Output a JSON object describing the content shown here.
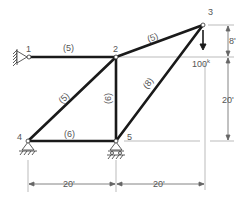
{
  "nodes": [
    {
      "id": "1",
      "label": "1"
    },
    {
      "id": "2",
      "label": "2"
    },
    {
      "id": "3",
      "label": "3"
    },
    {
      "id": "4",
      "label": "4"
    },
    {
      "id": "5",
      "label": "5"
    }
  ],
  "members": [
    {
      "from": "1",
      "to": "2",
      "label": "(5)"
    },
    {
      "from": "2",
      "to": "3",
      "label": "(5)"
    },
    {
      "from": "2",
      "to": "4",
      "label": "(5)"
    },
    {
      "from": "2",
      "to": "5",
      "label": "(6)"
    },
    {
      "from": "4",
      "to": "5",
      "label": "(6)"
    },
    {
      "from": "3",
      "to": "5",
      "label": "(8)"
    }
  ],
  "load": {
    "node": "3",
    "label": "100",
    "unit": "k"
  },
  "dimensions": {
    "vertical_top": "8'",
    "vertical_bottom": "20'",
    "horizontal_left": "20'",
    "horizontal_right": "20'"
  },
  "supports": {
    "node1": "wall-pin",
    "node4": "pin",
    "node5": "roller"
  }
}
